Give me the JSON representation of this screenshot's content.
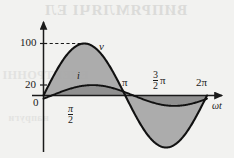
{
  "figure": {
    "title_hidden": "",
    "background_color": "#f2f2f0",
    "ink_color": "#1a1a1a",
    "fill_color": "#a6a6a6"
  },
  "bleed_through_text": {
    "top": "ВИПРЯМЛЯЧІ ЕЛ",
    "middle": "ЕЛЕКТРОННІ",
    "bottom": "напруги"
  },
  "axes": {
    "x_axis_label": "ωt",
    "y_axis_label": "",
    "origin_label": "0",
    "y_ticks": [
      {
        "label": "100",
        "value": 100
      },
      {
        "label": "20",
        "value": 20
      }
    ],
    "x_ticks": [
      {
        "label": "π/2",
        "numerator": "π",
        "denominator": "2",
        "value": 1.5707963
      },
      {
        "label": "π",
        "value": 3.1415927
      },
      {
        "label": "3/2 π",
        "numerator": "3",
        "denominator": "2",
        "suffix": "π",
        "value": 4.712389
      },
      {
        "label": "2π",
        "value": 6.2831853
      }
    ]
  },
  "curve_labels": {
    "voltage": "v",
    "current": "i"
  },
  "guides": {
    "peak_dashed_line": {
      "from_label": "100",
      "style": "dashed"
    }
  },
  "chart_data": {
    "type": "line",
    "title": "",
    "subtitle": "",
    "xlabel": "ωt",
    "ylabel": "",
    "xlim": [
      0,
      6.2831853
    ],
    "ylim": [
      -100,
      115
    ],
    "grid": false,
    "legend": "inline-curve-labels",
    "x_tick_values": [
      1.5707963,
      3.1415927,
      4.712389,
      6.2831853
    ],
    "x_tick_labels": [
      "π/2",
      "π",
      "3π/2",
      "2π"
    ],
    "y_tick_values": [
      20,
      100
    ],
    "y_tick_labels": [
      "20",
      "100"
    ],
    "series": [
      {
        "name": "v",
        "label": "v",
        "amplitude": 100,
        "phase_deg": 0,
        "form": "100 sin(ωt)",
        "filled": true,
        "x": [
          0,
          0.3927,
          0.7854,
          1.1781,
          1.5708,
          1.9635,
          2.3562,
          2.7489,
          3.1416,
          3.5343,
          3.927,
          4.3197,
          4.7124,
          5.1051,
          5.4978,
          5.8905,
          6.2832
        ],
        "values": [
          0,
          38.3,
          70.7,
          92.4,
          100,
          92.4,
          70.7,
          38.3,
          0,
          -38.3,
          -70.7,
          -92.4,
          -100,
          -92.4,
          -70.7,
          -38.3,
          0
        ]
      },
      {
        "name": "i",
        "label": "i",
        "amplitude": 20,
        "phase_deg": -18,
        "form": "20 sin(ωt − φ)",
        "filled": true,
        "x": [
          0,
          0.3927,
          0.7854,
          1.1781,
          1.5708,
          1.9635,
          2.3562,
          2.7489,
          3.1416,
          3.5343,
          3.927,
          4.3197,
          4.7124,
          5.1051,
          5.4978,
          5.8905,
          6.2832
        ],
        "values": [
          0,
          12.3,
          17.6,
          19.9,
          19.0,
          15.1,
          9.0,
          1.6,
          -6.2,
          -12.9,
          -17.4,
          -19.3,
          -18.5,
          -15.0,
          -9.4,
          -2.6,
          4.8
        ]
      }
    ],
    "annotations": [
      {
        "text": "100",
        "type": "y-tick-with-dashed-leader",
        "y": 100
      },
      {
        "text": "20",
        "type": "y-tick",
        "y": 20
      },
      {
        "text": "0",
        "type": "origin"
      },
      {
        "text": "v",
        "type": "curve-label"
      },
      {
        "text": "i",
        "type": "curve-label"
      }
    ]
  }
}
